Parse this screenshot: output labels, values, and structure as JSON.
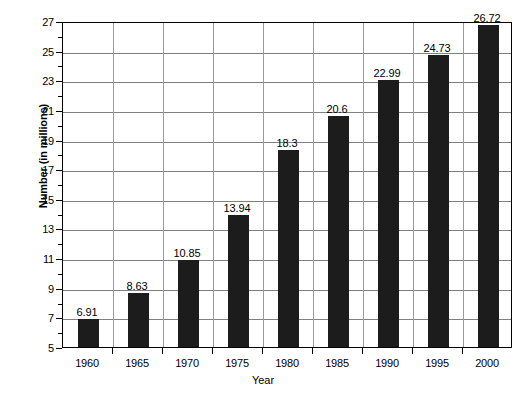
{
  "chart_data": {
    "type": "bar",
    "title": "",
    "xlabel": "Year",
    "ylabel": "Number (in millions)",
    "categories": [
      "1960",
      "1965",
      "1970",
      "1975",
      "1980",
      "1985",
      "1990",
      "1995",
      "2000"
    ],
    "values": [
      6.91,
      8.63,
      10.85,
      13.94,
      18.3,
      20.6,
      22.99,
      24.73,
      26.72
    ],
    "value_labels": [
      "6.91",
      "8.63",
      "10.85",
      "13.94",
      "18.3",
      "20.6",
      "22.99",
      "24.73",
      "26.72"
    ],
    "ylim": [
      5,
      27
    ],
    "ytick_labels": [
      "27",
      "25",
      "23",
      "21",
      "19",
      "17",
      "15",
      "13",
      "11",
      "9",
      "7",
      "5"
    ],
    "ytick_values": [
      27,
      25,
      23,
      21,
      19,
      17,
      15,
      13,
      11,
      9,
      7,
      5
    ],
    "y_major_step": 2,
    "y_minor_step": 1,
    "grid": true,
    "grid_axis": "y",
    "legend": false,
    "legend_position": "none",
    "bar_color": "#1c1c1c",
    "grid_color": "#808080",
    "axis_color": "#000000",
    "background_color": "#ffffff"
  }
}
